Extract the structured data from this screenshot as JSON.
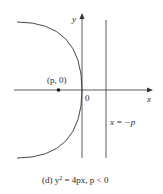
{
  "figure": {
    "axis_x_label": "x",
    "axis_y_label": "y",
    "origin_label": "0",
    "focus_label": "(p, 0)",
    "directrix_label": "x = −p",
    "caption_prefix": "(d) y",
    "caption_exp": "2",
    "caption_suffix": " = 4px, p < 0"
  },
  "colors": {
    "stroke": "#333333",
    "text": "#2a2a2a"
  }
}
